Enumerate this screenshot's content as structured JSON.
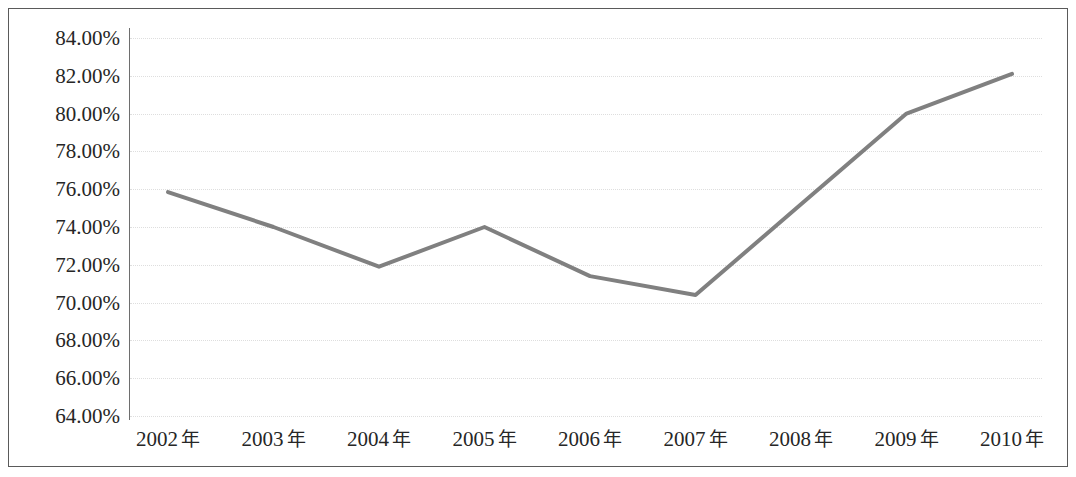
{
  "chart_data": {
    "type": "line",
    "title": "",
    "subtitle": "",
    "xlabel": "",
    "ylabel": "",
    "categories": [
      "2002 年",
      "2003 年",
      "2004 年",
      "2005 年",
      "2006 年",
      "2007 年",
      "2008 年",
      "2009 年",
      "2010 年"
    ],
    "x_values": [
      2002,
      2003,
      2004,
      2005,
      2006,
      2007,
      2008,
      2009,
      2010
    ],
    "values": [
      75.85,
      74.0,
      71.9,
      74.0,
      71.4,
      70.4,
      75.2,
      80.0,
      82.1
    ],
    "value_labels": [
      "75.85%",
      "74.00%",
      "71.90%",
      "74.00%",
      "71.40%",
      "70.40%",
      "75.20%",
      "80.00%",
      "82.10%"
    ],
    "ylim": [
      64,
      84
    ],
    "ytick_values": [
      64,
      66,
      68,
      70,
      72,
      74,
      76,
      78,
      80,
      82,
      84
    ],
    "ytick_labels": [
      "64.00%",
      "66.00%",
      "68.00%",
      "70.00%",
      "72.00%",
      "74.00%",
      "76.00%",
      "78.00%",
      "80.00%",
      "82.00%",
      "84.00%"
    ],
    "grid": true,
    "grid_axis": "y",
    "legend": false,
    "legend_position": "none",
    "series": [
      {
        "name": "",
        "color": "#808080",
        "line_width": 4,
        "markers": false,
        "values": [
          75.85,
          74.0,
          71.9,
          74.0,
          71.4,
          70.4,
          75.2,
          80.0,
          82.1
        ]
      }
    ],
    "colors": {
      "line": "#808080",
      "grid": "#dedede",
      "axis": "#6e6e6e",
      "text": "#262626",
      "border": "#5a5a5a",
      "background": "#ffffff"
    }
  }
}
